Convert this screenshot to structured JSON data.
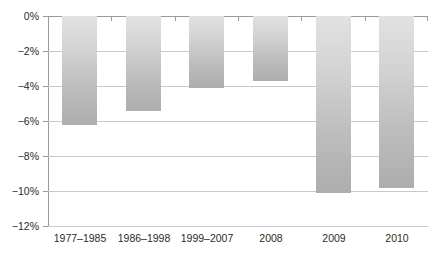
{
  "chart_data": {
    "type": "bar",
    "title": "",
    "subtitle": "",
    "xlabel": "",
    "ylabel": "",
    "categories": [
      "1977–1985",
      "1986–1998",
      "1999–2007",
      "2008",
      "2009",
      "2010"
    ],
    "values": [
      -6.2,
      -5.4,
      -4.1,
      -3.7,
      -10.1,
      -9.8
    ],
    "ylim": [
      -12,
      0
    ],
    "ytick_values": [
      0,
      -2,
      -4,
      -6,
      -8,
      -10,
      -12
    ],
    "ytick_labels": [
      "0%",
      "−2%",
      "−4%",
      "−6%",
      "−8%",
      "−10%",
      "−12%"
    ],
    "grid": true,
    "legend": false,
    "legend_position": "none",
    "annotations": [],
    "colors": {
      "bar_top": "#e2e2e2",
      "bar_bottom": "#adadad",
      "gridline": "#c9c9c9",
      "axis": "#9a9a9a",
      "text": "#2b2b2b",
      "background": "#ffffff"
    }
  }
}
